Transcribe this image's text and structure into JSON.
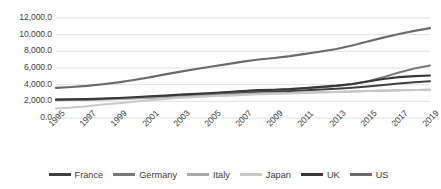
{
  "chart_data": {
    "type": "line",
    "title": "",
    "subtitle": "",
    "xlabel": "",
    "ylabel": "",
    "grid": true,
    "legend_position": "bottom",
    "ylim": [
      0,
      12000
    ],
    "yticks": [
      0,
      2000,
      4000,
      6000,
      8000,
      10000,
      12000
    ],
    "ytick_labels": [
      "0.0",
      "2,000.0",
      "4,000.0",
      "6,000.0",
      "8,000.0",
      "10,000.0",
      "12,000.0"
    ],
    "x": [
      1995,
      1996,
      1997,
      1998,
      1999,
      2000,
      2001,
      2002,
      2003,
      2004,
      2005,
      2006,
      2007,
      2008,
      2009,
      2010,
      2011,
      2012,
      2013,
      2014,
      2015,
      2016,
      2017,
      2018,
      2019
    ],
    "xtick_labels": [
      "1995",
      "1997",
      "1999",
      "2001",
      "2003",
      "2005",
      "2007",
      "2009",
      "2011",
      "2013",
      "2015",
      "2017",
      "2019"
    ],
    "xlim": [
      1995,
      2019
    ],
    "series": [
      {
        "name": "France",
        "color": "#404040",
        "width": 2.0,
        "values": [
          2180,
          2200,
          2230,
          2280,
          2330,
          2400,
          2480,
          2560,
          2650,
          2740,
          2830,
          2930,
          3040,
          3140,
          3180,
          3240,
          3330,
          3420,
          3520,
          3640,
          3790,
          3960,
          4130,
          4290,
          4420
        ]
      },
      {
        "name": "Germany",
        "color": "#7a7a7a",
        "width": 2.0,
        "values": [
          2150,
          2180,
          2210,
          2270,
          2330,
          2420,
          2520,
          2610,
          2720,
          2820,
          2930,
          3060,
          3200,
          3320,
          3370,
          3450,
          3580,
          3700,
          3850,
          4050,
          4400,
          4900,
          5450,
          5950,
          6300
        ]
      },
      {
        "name": "Italy",
        "color": "#a8a8a8",
        "width": 2.0,
        "values": [
          2120,
          2150,
          2180,
          2220,
          2270,
          2330,
          2400,
          2470,
          2550,
          2630,
          2700,
          2790,
          2880,
          2950,
          2970,
          3000,
          3050,
          3090,
          3130,
          3180,
          3230,
          3280,
          3320,
          3360,
          3400
        ]
      },
      {
        "name": "Japan",
        "color": "#c9c9c9",
        "width": 2.0,
        "values": [
          1150,
          1250,
          1420,
          1620,
          1780,
          1960,
          2120,
          2280,
          2420,
          2520,
          2600,
          2680,
          2760,
          2840,
          2880,
          2930,
          3000,
          3060,
          3120,
          3180,
          3240,
          3290,
          3320,
          3360,
          3390
        ]
      },
      {
        "name": "UK",
        "color": "#383838",
        "width": 2.2,
        "values": [
          2200,
          2230,
          2270,
          2330,
          2400,
          2490,
          2590,
          2690,
          2800,
          2900,
          3000,
          3120,
          3240,
          3340,
          3390,
          3470,
          3600,
          3730,
          3880,
          4080,
          4380,
          4680,
          4900,
          5020,
          5100
        ]
      },
      {
        "name": "US",
        "color": "#6b6b6b",
        "width": 2.2,
        "values": [
          3620,
          3720,
          3860,
          4050,
          4280,
          4560,
          4880,
          5230,
          5560,
          5880,
          6180,
          6470,
          6760,
          7020,
          7200,
          7420,
          7700,
          7980,
          8280,
          8700,
          9180,
          9640,
          10080,
          10450,
          10780
        ]
      }
    ]
  },
  "legend": {
    "items": [
      {
        "label": "France",
        "color": "#404040"
      },
      {
        "label": "Germany",
        "color": "#7a7a7a"
      },
      {
        "label": "Italy",
        "color": "#a8a8a8"
      },
      {
        "label": "Japan",
        "color": "#c9c9c9"
      },
      {
        "label": "UK",
        "color": "#383838"
      },
      {
        "label": "US",
        "color": "#6b6b6b"
      }
    ]
  },
  "colors": {
    "background": "#ffffff",
    "gridline": "#e2e2e2",
    "axis_text": "#3f3f3f"
  }
}
